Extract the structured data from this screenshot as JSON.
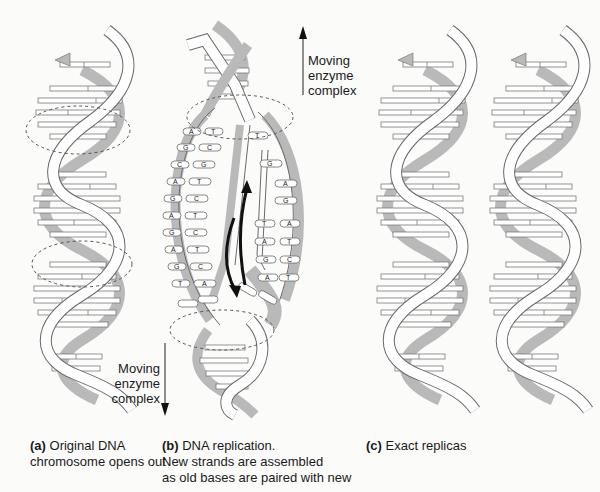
{
  "figure": {
    "panels": [
      {
        "id": "a",
        "tag": "(a)",
        "caption_line1": "Original DNA",
        "caption_line2": "chromosome opens out"
      },
      {
        "id": "b",
        "tag": "(b)",
        "caption_line1": "DNA replication.",
        "caption_line2": "New strands are assembled",
        "caption_line3": "as old bases are paired with new"
      },
      {
        "id": "c",
        "tag": "(c)",
        "caption_line1": "Exact replicas"
      }
    ],
    "arrows": {
      "up": {
        "line1": "Moving",
        "line2": "enzyme",
        "line3": "complex",
        "direction": "up"
      },
      "down": {
        "line1": "Moving",
        "line2": "enzyme",
        "line3": "complex",
        "direction": "down"
      }
    },
    "bases": {
      "left_old": [
        "A",
        "G",
        "C",
        "A",
        "G",
        "A",
        "G",
        "A",
        "G",
        "T"
      ],
      "left_new": [
        "T",
        "C",
        "G",
        "T",
        "C",
        "T",
        "C",
        "T",
        "C",
        "A"
      ],
      "right_new": [
        "T",
        "G",
        "A",
        "G",
        "T",
        "A",
        "G",
        "A"
      ],
      "right_old": [
        "C",
        "G",
        "A",
        "G",
        "A",
        "T",
        "C",
        "T"
      ]
    },
    "colors": {
      "strand_fill": "#ffffff",
      "strand_stroke": "#6a6a6a",
      "back_strand": "#b9b9b9",
      "text": "#1a1a1a",
      "background": "#fbfbfa"
    }
  }
}
